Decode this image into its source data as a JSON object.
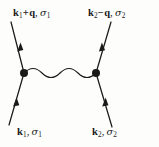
{
  "diagram": {
    "type": "feynman-diagram",
    "background_color": "#fdfdfc",
    "line_color": "#1a1a1a",
    "canvas": {
      "width": 159,
      "height": 147
    },
    "labels": {
      "top_left": {
        "momentum": "k",
        "momentum_sub": "1",
        "operator": "+",
        "transfer": "q",
        "spin": "σ",
        "spin_sub": "1",
        "text": "k₁+q, σ₁"
      },
      "top_right": {
        "momentum": "k",
        "momentum_sub": "2",
        "operator": "−",
        "transfer": "q",
        "spin": "σ",
        "spin_sub": "2",
        "text": "k₂−q, σ₂"
      },
      "bottom_left": {
        "momentum": "k",
        "momentum_sub": "1",
        "operator": "",
        "transfer": "",
        "spin": "σ",
        "spin_sub": "1",
        "text": "k₁, σ₁"
      },
      "bottom_right": {
        "momentum": "k",
        "momentum_sub": "2",
        "operator": "",
        "transfer": "",
        "spin": "σ",
        "spin_sub": "2",
        "text": "k₂, σ₂"
      }
    },
    "vertices": [
      {
        "name": "left-vertex",
        "x": 24,
        "y": 73,
        "radius": 4
      },
      {
        "name": "right-vertex",
        "x": 96,
        "y": 73,
        "radius": 4
      }
    ],
    "fermion_lines": [
      {
        "name": "incoming-left",
        "x1": 9,
        "y1": 125,
        "x2": 24,
        "y2": 73,
        "arrow_direction": "up"
      },
      {
        "name": "outgoing-left",
        "x1": 24,
        "y1": 73,
        "x2": 11,
        "y2": 22,
        "arrow_direction": "up"
      },
      {
        "name": "incoming-right",
        "x1": 112,
        "y1": 127,
        "x2": 96,
        "y2": 73,
        "arrow_direction": "up"
      },
      {
        "name": "outgoing-right",
        "x1": 96,
        "y1": 73,
        "x2": 111,
        "y2": 22,
        "arrow_direction": "up"
      }
    ],
    "interaction_line": {
      "name": "wavy-interaction-line",
      "x_start": 24,
      "x_end": 96,
      "y_center": 73,
      "amplitude": 5,
      "oscillations": 4
    }
  }
}
